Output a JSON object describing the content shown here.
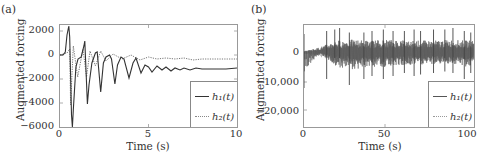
{
  "panels": [
    {
      "label": "(a)",
      "ylabel": "Augmented forcing",
      "xlabel": "Time (s)",
      "yticks": [
        "2000",
        "0",
        "−2000",
        "−4000",
        "−6000"
      ],
      "xticks": [
        "0",
        "5",
        "10"
      ],
      "legend": [
        "h₁(t)",
        "h₂(t)"
      ]
    },
    {
      "label": "(b)",
      "ylabel": "Augmented forcing",
      "xlabel": "Time (s)",
      "yticks": [
        "0",
        "−10,000",
        "−20,000"
      ],
      "xticks": [
        "0",
        "50",
        "100"
      ],
      "legend": [
        "h₁(t)",
        "h₂(t)"
      ]
    }
  ],
  "chart_data": [
    {
      "type": "line",
      "title": "(a)",
      "xlabel": "Time (s)",
      "ylabel": "Augmented forcing",
      "xlim": [
        0,
        10
      ],
      "ylim": [
        -6000,
        2500
      ],
      "grid": false,
      "legend_position": "lower right",
      "series": [
        {
          "name": "h1(t)",
          "style": "solid",
          "x": [
            0,
            0.3,
            0.5,
            0.55,
            0.65,
            0.7,
            0.9,
            1.2,
            1.4,
            1.55,
            1.8,
            2.1,
            2.3,
            2.5,
            2.8,
            3.1,
            3.5,
            3.9,
            4.3,
            4.8,
            5.3,
            5.8,
            6.3,
            6.8,
            7.3,
            7.8,
            8.3,
            9,
            10
          ],
          "y": [
            0,
            200,
            2400,
            1500,
            -5000,
            -6000,
            -1000,
            -200,
            1200,
            -4100,
            -600,
            400,
            -3100,
            -400,
            0,
            -2400,
            -200,
            -1900,
            -500,
            -1500,
            -800,
            -1300,
            -900,
            -1300,
            -1000,
            -1200,
            -1050,
            -1150,
            -1100
          ]
        },
        {
          "name": "h2(t)",
          "style": "dotted",
          "x": [
            0,
            0.4,
            0.55,
            0.6,
            0.75,
            1.0,
            1.3,
            1.5,
            1.7,
            2.0,
            2.3,
            2.6,
            3.0,
            3.5,
            4.0,
            4.5,
            5.0,
            6.0,
            7.0,
            8.0,
            9.0,
            10.0
          ],
          "y": [
            0,
            200,
            500,
            -4200,
            800,
            -1800,
            500,
            -1800,
            300,
            -900,
            300,
            -500,
            100,
            -300,
            0,
            -400,
            -200,
            -300,
            -250,
            -350,
            -300,
            -300
          ]
        }
      ]
    },
    {
      "type": "line",
      "title": "(b)",
      "xlabel": "Time (s)",
      "ylabel": "Augmented forcing",
      "xlim": [
        0,
        105
      ],
      "ylim": [
        -25000,
        9000
      ],
      "grid": false,
      "legend_position": "lower right",
      "series": [
        {
          "name": "h1(t)",
          "style": "solid",
          "description": "dense oscillation around 0 with intermittent spikes",
          "envelope_upper": [
            500,
            3000,
            7000,
            7500,
            7000,
            7500,
            7500,
            7000,
            7000,
            7500,
            7000
          ],
          "envelope_lower": [
            -12000,
            -1000,
            -9000,
            -11000,
            -9000,
            -9000,
            -8000,
            -8000,
            -7500,
            -7000,
            -9000
          ],
          "x": [
            0,
            10,
            20,
            30,
            40,
            50,
            60,
            70,
            80,
            90,
            100
          ]
        },
        {
          "name": "h2(t)",
          "style": "dotted",
          "description": "dense oscillation around 0 with smaller amplitude",
          "envelope_upper": [
            300,
            2500,
            5000,
            5000,
            5000,
            5000,
            5000,
            5000,
            5000,
            5000,
            5000
          ],
          "envelope_lower": [
            -1000,
            -3000,
            -6000,
            -6000,
            -6500,
            -6000,
            -6000,
            -6000,
            -6000,
            -6000,
            -6000
          ],
          "x": [
            0,
            10,
            20,
            30,
            40,
            50,
            60,
            70,
            80,
            90,
            100
          ]
        }
      ]
    }
  ]
}
